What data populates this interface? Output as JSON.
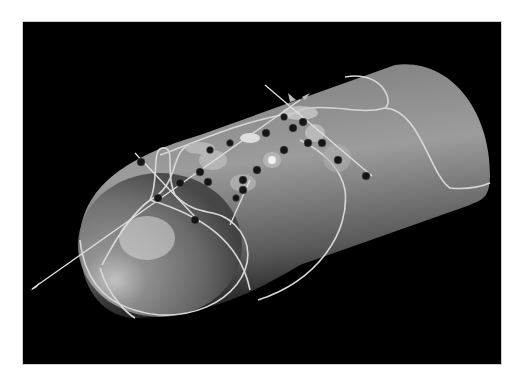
{
  "figure": {
    "background_color": "#000000",
    "page_color": "#ffffff",
    "surface_color": "#8a8a8a",
    "highlight_color": "#cfcfcf",
    "line_color": "#d8d8d8",
    "glyph_color": "#1a1a1a"
  },
  "axis_line": {
    "x1": 30,
    "y1": 290,
    "x2": 300,
    "y2": 100
  },
  "axis_line2": {
    "x1": 135,
    "y1": 152,
    "x2": 200,
    "y2": 220
  },
  "axis_line3": {
    "x1": 265,
    "y1": 85,
    "x2": 370,
    "y2": 175
  },
  "glyphs": [
    {
      "x": 141,
      "y": 162
    },
    {
      "x": 158,
      "y": 198
    },
    {
      "x": 180,
      "y": 183
    },
    {
      "x": 195,
      "y": 220
    },
    {
      "x": 208,
      "y": 182
    },
    {
      "x": 200,
      "y": 172
    },
    {
      "x": 210,
      "y": 150
    },
    {
      "x": 230,
      "y": 143
    },
    {
      "x": 243,
      "y": 190
    },
    {
      "x": 257,
      "y": 170
    },
    {
      "x": 266,
      "y": 133
    },
    {
      "x": 284,
      "y": 150
    },
    {
      "x": 293,
      "y": 128
    },
    {
      "x": 303,
      "y": 122
    },
    {
      "x": 308,
      "y": 143
    },
    {
      "x": 322,
      "y": 143
    },
    {
      "x": 338,
      "y": 160
    },
    {
      "x": 366,
      "y": 176
    },
    {
      "x": 243,
      "y": 180
    },
    {
      "x": 284,
      "y": 117
    },
    {
      "x": 236,
      "y": 198
    }
  ],
  "disks": [
    {
      "x": 300,
      "y": 113,
      "rx": 18,
      "ry": 7
    },
    {
      "x": 200,
      "y": 148,
      "rx": 15,
      "ry": 6
    },
    {
      "x": 213,
      "y": 160,
      "rx": 14,
      "ry": 10
    },
    {
      "x": 250,
      "y": 138,
      "rx": 10,
      "ry": 5
    },
    {
      "x": 272,
      "y": 160,
      "rx": 9,
      "ry": 8
    },
    {
      "x": 243,
      "y": 183,
      "rx": 13,
      "ry": 9
    },
    {
      "x": 315,
      "y": 133,
      "rx": 10,
      "ry": 9
    },
    {
      "x": 337,
      "y": 158,
      "rx": 14,
      "ry": 14
    }
  ]
}
